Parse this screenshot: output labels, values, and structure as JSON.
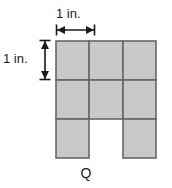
{
  "figure": {
    "name": "Q",
    "caption": "Q",
    "unit_square_count": 8,
    "grid": {
      "columns": 3,
      "rows": 3,
      "cell_size_label": "1 in.",
      "filled_cells": [
        {
          "row": 0,
          "col": 0
        },
        {
          "row": 0,
          "col": 1
        },
        {
          "row": 0,
          "col": 2
        },
        {
          "row": 1,
          "col": 0
        },
        {
          "row": 1,
          "col": 1
        },
        {
          "row": 1,
          "col": 2
        },
        {
          "row": 2,
          "col": 0
        },
        {
          "row": 2,
          "col": 2
        }
      ],
      "missing_cells": [
        {
          "row": 2,
          "col": 1
        }
      ]
    },
    "dimensions": {
      "width_label": "1 in.",
      "height_label": "1 in."
    },
    "colors": {
      "fill": "#c8c8c8",
      "stroke": "#666666",
      "dimension_line": "#1a1a1a",
      "background": "#ffffff",
      "text": "#1a1a1a"
    }
  }
}
